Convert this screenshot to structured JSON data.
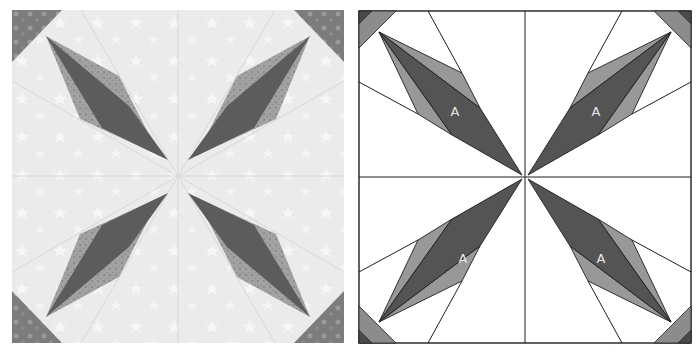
{
  "figure": {
    "left_panel": {
      "kind": "photograph",
      "description": "Sewn quilt block, grayscale photo: four dark spiky blades radiating from center on a light star-print background, with batik corner strips",
      "colors": {
        "background": "#ececec",
        "seam": "#d6d6d6",
        "blade_dark": "#5e5e5e",
        "blade_light": "#9a9a9a",
        "corner": "#7a7a7a"
      }
    },
    "right_panel": {
      "kind": "line diagram",
      "description": "Paper-piecing diagram of the same block: square divided into quadrants, each with a blade made of a dark center piece labeled A flanked by two lighter pieces, diagonal corner strips",
      "piece_label": "A",
      "labels": [
        "A",
        "A",
        "A",
        "A"
      ],
      "colors": {
        "background": "#ffffff",
        "outline": "#1e1e1e",
        "dark": "#545454",
        "medium": "#989898",
        "corner_dark": "#4a4a4a",
        "corner_band": "#8c8c8c"
      }
    },
    "caption": "· · ·  · ·"
  }
}
